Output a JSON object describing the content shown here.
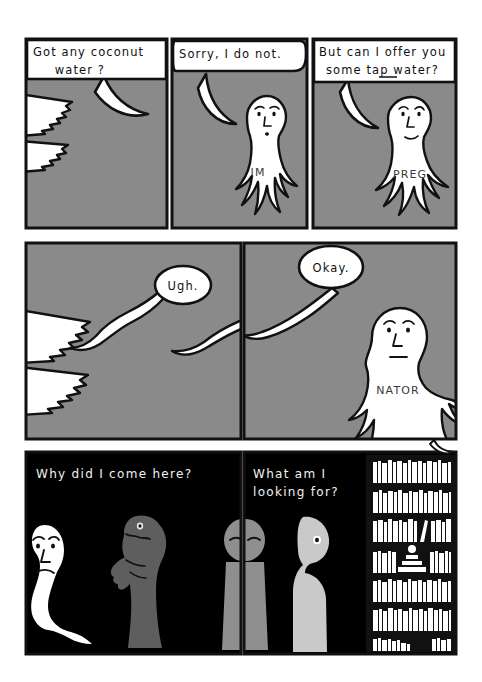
{
  "comic": {
    "title": "Comic strip — eight panels",
    "background_color": "#ffffff",
    "panel_border_color": "#111111",
    "gray_fill": "#8a8a8a",
    "dark_fill": "#000000",
    "figure_white": "#ffffff",
    "figure_gray": "#8f8f8f",
    "figure_light_gray": "#c9c9c9",
    "figure_dark_gray": "#5e5e5e",
    "rows": [
      {
        "row_name": "top-row",
        "panels": [
          {
            "panel_name": "panel-1",
            "speech": "Got any coconut water?",
            "speech_line_1": "Got any coconut",
            "speech_line_2": "water ?",
            "background": "gray",
            "contents": "toothed creature jaws at left edge"
          },
          {
            "panel_name": "panel-2",
            "speech": "Sorry, I do not.",
            "speech_line_1": "Sorry, I do not.",
            "speech_line_2": "",
            "background": "gray",
            "body_text": "IM",
            "contents": "white ghost figure"
          },
          {
            "panel_name": "panel-3",
            "speech": "But can I offer you some tap water?",
            "speech_line_1": "But can I offer you",
            "speech_line_2": "some tap water?",
            "underlined_word": "tap",
            "background": "gray",
            "body_text": "PREG",
            "contents": "white ghost figure"
          }
        ]
      },
      {
        "row_name": "middle-row",
        "panels": [
          {
            "panel_name": "panel-4",
            "speech": "Ugh.",
            "background": "gray",
            "contents": "toothed creature jaws at left edge, wavy speech tail"
          },
          {
            "panel_name": "panel-5",
            "speech": "Okay.",
            "background": "gray",
            "body_text": "NATOR",
            "contents": "white ghost figure"
          }
        ]
      },
      {
        "row_name": "bottom-row",
        "panels": [
          {
            "panel_name": "panel-6",
            "caption_line_1": "Why did I come here?",
            "caption_line_2": "",
            "background": "black",
            "contents": "white ghost, gray lizard creature, gray figure at right edge"
          },
          {
            "panel_name": "panel-7",
            "caption_line_1": "What am I",
            "caption_line_2": "looking for?",
            "background": "black",
            "contents": "two gray humanoid figures and a bookshelf full of books"
          }
        ]
      }
    ],
    "hidden_message": "IM PREG NATOR",
    "bookshelf": {
      "name": "bookshelf",
      "shelf_count": 7,
      "ornament": "stepped pyramid with sphere on top"
    }
  }
}
